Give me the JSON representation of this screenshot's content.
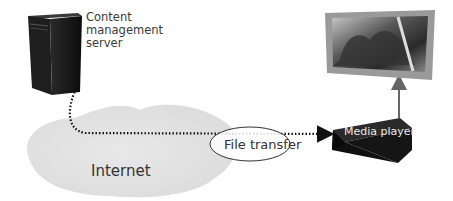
{
  "diagram": {
    "nodes": {
      "server": {
        "label": "Content management server",
        "lines": [
          "Content",
          "management",
          "server"
        ],
        "icon": "server-tower-icon"
      },
      "internet": {
        "label": "Internet",
        "icon": "cloud-icon"
      },
      "media_player": {
        "label": "Media player",
        "icon": "media-player-box-icon"
      },
      "display": {
        "label": "Display",
        "icon": "tv-screen-icon"
      }
    },
    "edges": [
      {
        "from": "server",
        "to": "media_player",
        "style": "dotted",
        "label": "File transfer"
      },
      {
        "from": "media_player",
        "to": "display",
        "style": "solid",
        "label": ""
      }
    ],
    "colors": {
      "server": "#111111",
      "cloud": "#e4e4e4",
      "arrow_dotted": "#111111",
      "arrow_solid": "#666666",
      "tv_frame": "#9a9a9a"
    }
  }
}
